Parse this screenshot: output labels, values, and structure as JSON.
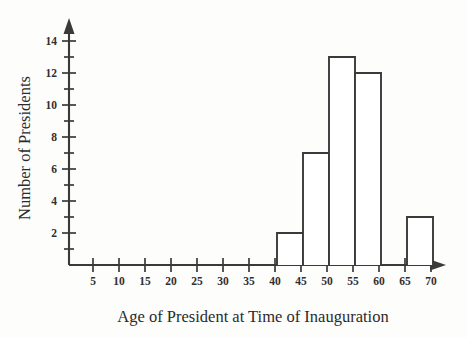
{
  "chart_data": {
    "type": "bar",
    "title": "",
    "subtitle": "",
    "xlabel": "Age of President at Time of Inauguration",
    "ylabel": "Number of Presidents",
    "grid": false,
    "legend": "none",
    "bin_width": 5,
    "xlim": [
      0,
      72
    ],
    "ylim": [
      0,
      14
    ],
    "x_ticks": [
      5,
      10,
      15,
      20,
      25,
      30,
      35,
      40,
      45,
      50,
      55,
      60,
      65,
      70
    ],
    "x_tick_labels": [
      "5",
      "10",
      "15",
      "20",
      "25",
      "30",
      "35",
      "40",
      "45",
      "50",
      "55",
      "60",
      "65",
      "70"
    ],
    "y_ticks": [
      2,
      4,
      6,
      8,
      10,
      12,
      14
    ],
    "y_tick_labels": [
      "2",
      "4",
      "6",
      "8",
      "10",
      "12",
      "14"
    ],
    "y_minor_ticks": [
      1,
      3,
      5,
      7,
      9,
      11,
      13
    ],
    "categories": [
      "40-45",
      "45-50",
      "50-55",
      "55-60",
      "60-65",
      "65-70"
    ],
    "bins": [
      {
        "start": 40,
        "end": 45,
        "value": 2
      },
      {
        "start": 45,
        "end": 50,
        "value": 7
      },
      {
        "start": 50,
        "end": 55,
        "value": 13
      },
      {
        "start": 55,
        "end": 60,
        "value": 12
      },
      {
        "start": 60,
        "end": 65,
        "value": 0
      },
      {
        "start": 65,
        "end": 70,
        "value": 3
      }
    ],
    "values": [
      2,
      7,
      13,
      12,
      0,
      3
    ]
  },
  "colors": {
    "background": "#fdfdfc",
    "axis": "#3a3a3a",
    "bar_stroke": "#3a3a3a",
    "bar_fill": "#ffffff",
    "text": "#2b2b2b"
  }
}
